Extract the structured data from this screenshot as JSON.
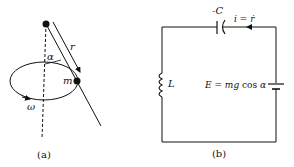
{
  "figure_a": {
    "caption": "(a)",
    "labels": {
      "r": "r",
      "alpha": "α",
      "m": "m",
      "omega": "ω"
    }
  },
  "figure_b": {
    "caption": "(b)",
    "labels": {
      "capacitor": "-C",
      "current": "i = ṙ",
      "inductor": "L",
      "source": "E = mg cos α"
    }
  },
  "colors": {
    "ink": "#111111",
    "background": "#ffffff"
  }
}
